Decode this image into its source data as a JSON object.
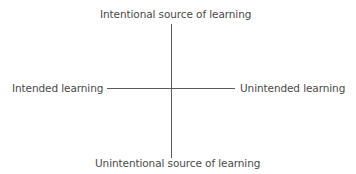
{
  "diagram": {
    "type": "quadrant-axes",
    "axes": {
      "vertical": {
        "top_label": "Intentional source of learning",
        "bottom_label": "Unintentional source of learning"
      },
      "horizontal": {
        "left_label": "Intended learning",
        "right_label": "Unintended learning"
      }
    },
    "line_color": "#5a5a5a",
    "text_color": "#4a4a4a"
  }
}
